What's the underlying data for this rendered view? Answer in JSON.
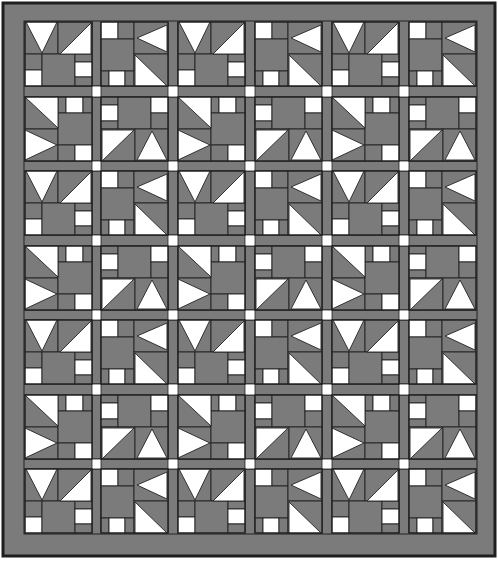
{
  "colors": {
    "background": "#ffffff",
    "fabric_gray": "#7b7b7b",
    "fabric_white": "#ffffff",
    "seam_line": "#222222",
    "outer_edge": "#1e1e1e"
  },
  "quilt": {
    "outer": {
      "x": 3,
      "y": 3,
      "w": 492,
      "h": 553
    },
    "inner": {
      "x": 24,
      "y": 21,
      "w": 453,
      "h": 513
    },
    "columns": 6,
    "rows": 7,
    "col_x": [
      25,
      101,
      178,
      255,
      332,
      409
    ],
    "row_y": [
      22,
      97,
      171,
      246,
      320,
      395,
      469
    ],
    "block_w": 67,
    "block_h": 64,
    "sashing_w": 10,
    "layout_note": "Odd rows alternate blocks A,B; even rows alternate blocks C,D; white cornerstones at sashing intersections"
  },
  "block_pattern": [
    [
      "A",
      "B",
      "A",
      "B",
      "A",
      "B"
    ],
    [
      "C",
      "D",
      "C",
      "D",
      "C",
      "D"
    ],
    [
      "A",
      "B",
      "A",
      "B",
      "A",
      "B"
    ],
    [
      "C",
      "D",
      "C",
      "D",
      "C",
      "D"
    ],
    [
      "A",
      "B",
      "A",
      "B",
      "A",
      "B"
    ],
    [
      "C",
      "D",
      "C",
      "D",
      "C",
      "D"
    ],
    [
      "A",
      "B",
      "A",
      "B",
      "A",
      "B"
    ]
  ],
  "blocks": {
    "A": {
      "name": "v-triangle-block",
      "rects": [
        {
          "x": 0,
          "y": 0,
          "w": 33,
          "h": 32,
          "fill": "gray"
        },
        {
          "x": 33,
          "y": 0,
          "w": 34,
          "h": 32,
          "fill": "gray"
        },
        {
          "x": 0,
          "y": 32,
          "w": 17,
          "h": 16,
          "fill": "gray"
        },
        {
          "x": 0,
          "y": 48,
          "w": 17,
          "h": 16,
          "fill": "white"
        },
        {
          "x": 17,
          "y": 32,
          "w": 33,
          "h": 32,
          "fill": "gray"
        },
        {
          "x": 50,
          "y": 32,
          "w": 17,
          "h": 8,
          "fill": "gray"
        },
        {
          "x": 50,
          "y": 40,
          "w": 17,
          "h": 15,
          "fill": "white"
        },
        {
          "x": 50,
          "y": 55,
          "w": 17,
          "h": 9,
          "fill": "gray"
        }
      ],
      "triangles": [
        {
          "points": "1,0 32,0 17,31",
          "fill": "white"
        },
        {
          "points": "66,1 66,32 35,32",
          "fill": "white"
        }
      ]
    },
    "B": {
      "name": "arrow-left-block",
      "rects": [
        {
          "x": 0,
          "y": 0,
          "w": 17,
          "h": 17,
          "fill": "white"
        },
        {
          "x": 17,
          "y": 0,
          "w": 16,
          "h": 17,
          "fill": "gray"
        },
        {
          "x": 0,
          "y": 17,
          "w": 33,
          "h": 32,
          "fill": "gray"
        },
        {
          "x": 0,
          "y": 49,
          "w": 8,
          "h": 15,
          "fill": "gray"
        },
        {
          "x": 8,
          "y": 49,
          "w": 16,
          "h": 15,
          "fill": "white"
        },
        {
          "x": 24,
          "y": 49,
          "w": 9,
          "h": 15,
          "fill": "gray"
        },
        {
          "x": 33,
          "y": 0,
          "w": 34,
          "h": 32,
          "fill": "gray"
        },
        {
          "x": 33,
          "y": 32,
          "w": 34,
          "h": 32,
          "fill": "gray"
        }
      ],
      "triangles": [
        {
          "points": "66,3 66,30 36,16",
          "fill": "white"
        },
        {
          "points": "34,33 66,64 34,64",
          "fill": "white"
        }
      ]
    },
    "C": {
      "name": "arrow-right-block",
      "rects": [
        {
          "x": 0,
          "y": 0,
          "w": 33,
          "h": 32,
          "fill": "gray"
        },
        {
          "x": 0,
          "y": 32,
          "w": 33,
          "h": 32,
          "fill": "gray"
        },
        {
          "x": 33,
          "y": 0,
          "w": 8,
          "h": 16,
          "fill": "gray"
        },
        {
          "x": 41,
          "y": 0,
          "w": 17,
          "h": 16,
          "fill": "white"
        },
        {
          "x": 58,
          "y": 0,
          "w": 9,
          "h": 16,
          "fill": "gray"
        },
        {
          "x": 33,
          "y": 16,
          "w": 34,
          "h": 32,
          "fill": "gray"
        },
        {
          "x": 33,
          "y": 48,
          "w": 17,
          "h": 16,
          "fill": "gray"
        },
        {
          "x": 50,
          "y": 48,
          "w": 17,
          "h": 16,
          "fill": "white"
        }
      ],
      "triangles": [
        {
          "points": "0,0 33,0 33,31",
          "fill": "white"
        },
        {
          "points": "0,33 32,48 0,63",
          "fill": "white"
        }
      ]
    },
    "D": {
      "name": "arrow-up-block",
      "rects": [
        {
          "x": 0,
          "y": 0,
          "w": 17,
          "h": 8,
          "fill": "gray"
        },
        {
          "x": 0,
          "y": 8,
          "w": 17,
          "h": 16,
          "fill": "white"
        },
        {
          "x": 0,
          "y": 24,
          "w": 17,
          "h": 8,
          "fill": "gray"
        },
        {
          "x": 17,
          "y": 0,
          "w": 33,
          "h": 32,
          "fill": "gray"
        },
        {
          "x": 50,
          "y": 0,
          "w": 17,
          "h": 16,
          "fill": "white"
        },
        {
          "x": 50,
          "y": 16,
          "w": 17,
          "h": 16,
          "fill": "gray"
        },
        {
          "x": 0,
          "y": 32,
          "w": 34,
          "h": 32,
          "fill": "gray"
        },
        {
          "x": 34,
          "y": 32,
          "w": 33,
          "h": 32,
          "fill": "gray"
        }
      ],
      "triangles": [
        {
          "points": "1,33 33,33 1,64",
          "fill": "white"
        },
        {
          "points": "51,34 66,63 36,63",
          "fill": "white"
        }
      ]
    }
  }
}
